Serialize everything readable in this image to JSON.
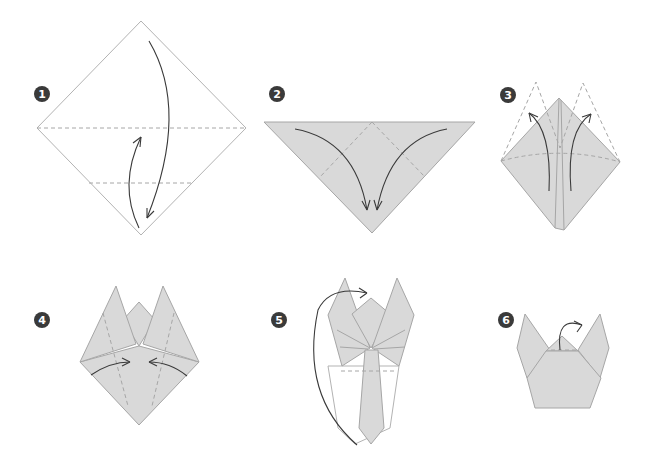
{
  "colors": {
    "paper": "#d9d9d9",
    "paper_edge": "#a6a6a6",
    "badge": "#3a3a3a",
    "arrow": "#3a3a3a",
    "background": "#ffffff"
  },
  "steps": [
    {
      "number": "1",
      "description": "Square paper as diamond, fold top corner down to bottom along horizontal crease"
    },
    {
      "number": "2",
      "description": "Triangle; fold left and right corners down to bottom point"
    },
    {
      "number": "3",
      "description": "Diamond; fold lower flaps up diagonally to form petals"
    },
    {
      "number": "4",
      "description": "Fold side corners in toward center"
    },
    {
      "number": "5",
      "description": "Turn over to the back"
    },
    {
      "number": "6",
      "description": "Finished tulip; fold top tip back"
    }
  ]
}
